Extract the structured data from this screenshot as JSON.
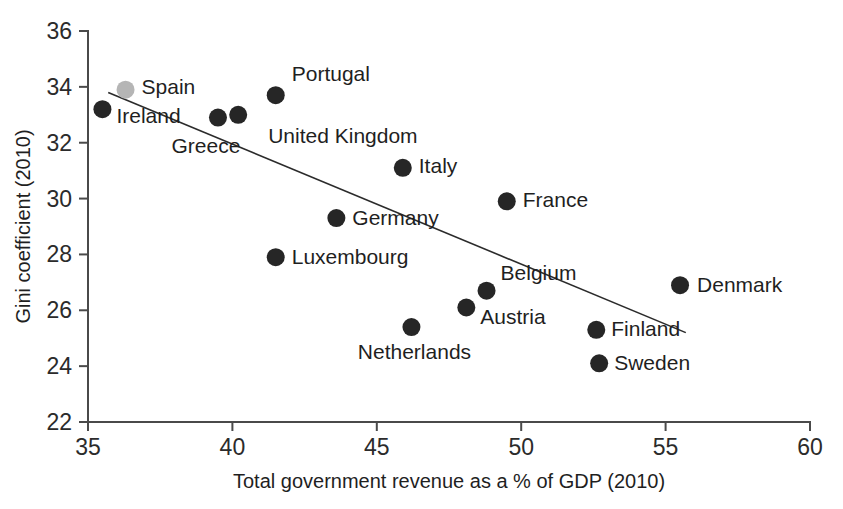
{
  "chart_data": {
    "type": "scatter",
    "title": "",
    "xlabel": "Total government revenue as a % of GDP (2010)",
    "ylabel": "Gini coefficient (2010)",
    "xlim": [
      35,
      60
    ],
    "ylim": [
      22,
      36
    ],
    "xticks": [
      "35",
      "40",
      "45",
      "50",
      "55",
      "60"
    ],
    "yticks": [
      "22",
      "24",
      "26",
      "28",
      "30",
      "32",
      "34",
      "36"
    ],
    "grid": false,
    "legend": "none",
    "point_color": "#262626",
    "highlight_color": "#b5b5b5",
    "trendline": {
      "label": "linear fit",
      "x": [
        35.7,
        55.7
      ],
      "y": [
        33.8,
        25.2
      ],
      "color": "#2b2b2b"
    },
    "points": [
      {
        "name": "Ireland",
        "x": 35.5,
        "y": 33.2,
        "color": "#262626",
        "label_dx": 14,
        "label_dy": 8,
        "label_anchor": "start"
      },
      {
        "name": "Spain",
        "x": 36.3,
        "y": 33.9,
        "color": "#b5b5b5",
        "label_dx": 16,
        "label_dy": -1,
        "label_anchor": "start"
      },
      {
        "name": "Greece",
        "x": 39.5,
        "y": 32.9,
        "color": "#262626",
        "label_dx": -12,
        "label_dy": 30,
        "label_anchor": "middle"
      },
      {
        "name": "United Kingdom",
        "x": 40.2,
        "y": 33.0,
        "color": "#262626",
        "label_dx": 30,
        "label_dy": 23,
        "label_anchor": "start"
      },
      {
        "name": "Portugal",
        "x": 41.5,
        "y": 33.7,
        "color": "#262626",
        "label_dx": 16,
        "label_dy": -20,
        "label_anchor": "start"
      },
      {
        "name": "Italy",
        "x": 45.9,
        "y": 31.1,
        "color": "#262626",
        "label_dx": 16,
        "label_dy": 0,
        "label_anchor": "start"
      },
      {
        "name": "France",
        "x": 49.5,
        "y": 29.9,
        "color": "#262626",
        "label_dx": 16,
        "label_dy": 0,
        "label_anchor": "start"
      },
      {
        "name": "Germany",
        "x": 43.6,
        "y": 29.3,
        "color": "#262626",
        "label_dx": 16,
        "label_dy": 1,
        "label_anchor": "start"
      },
      {
        "name": "Luxembourg",
        "x": 41.5,
        "y": 27.9,
        "color": "#262626",
        "label_dx": 16,
        "label_dy": 1,
        "label_anchor": "start"
      },
      {
        "name": "Belgium",
        "x": 48.8,
        "y": 26.7,
        "color": "#262626",
        "label_dx": 14,
        "label_dy": -16,
        "label_anchor": "start"
      },
      {
        "name": "Austria",
        "x": 48.1,
        "y": 26.1,
        "color": "#262626",
        "label_dx": 14,
        "label_dy": 11,
        "label_anchor": "start"
      },
      {
        "name": "Netherlands",
        "x": 46.2,
        "y": 25.4,
        "color": "#262626",
        "label_dx": 3,
        "label_dy": 26,
        "label_anchor": "middle"
      },
      {
        "name": "Finland",
        "x": 52.6,
        "y": 25.3,
        "color": "#262626",
        "label_dx": 15,
        "label_dy": 1,
        "label_anchor": "start"
      },
      {
        "name": "Sweden",
        "x": 52.7,
        "y": 24.1,
        "color": "#262626",
        "label_dx": 15,
        "label_dy": 1,
        "label_anchor": "start"
      },
      {
        "name": "Denmark",
        "x": 55.5,
        "y": 26.9,
        "color": "#262626",
        "label_dx": 17,
        "label_dy": 1,
        "label_anchor": "start"
      }
    ]
  }
}
